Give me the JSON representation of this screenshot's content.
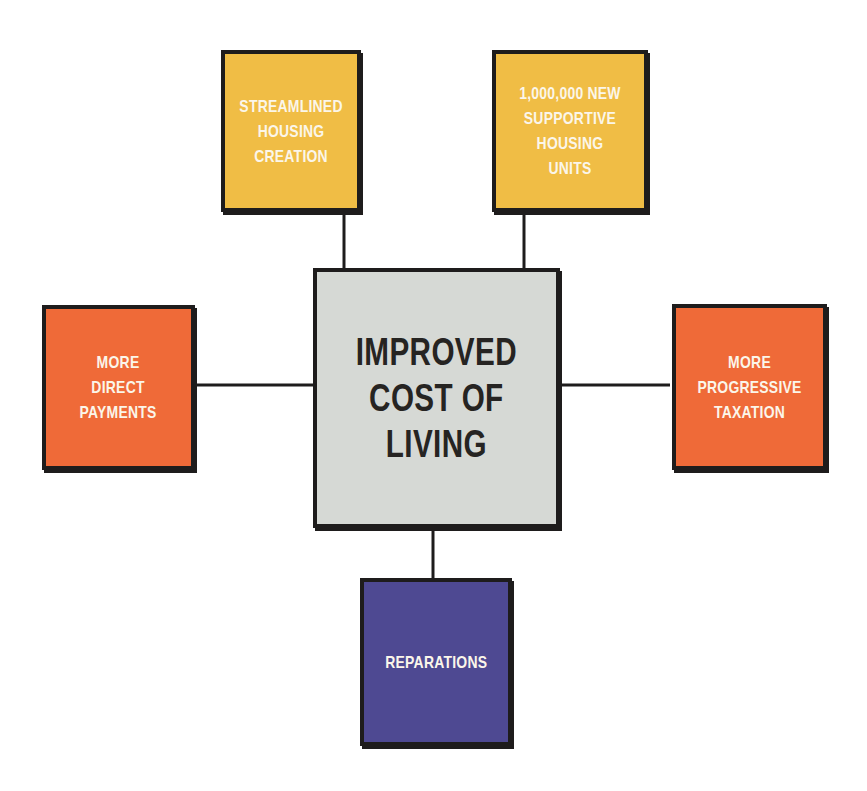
{
  "diagram": {
    "center": {
      "label": "IMPROVED\nCOST OF\nLIVING",
      "color": "#d6d9d5"
    },
    "inputs": [
      {
        "id": "streamlined-housing",
        "label": "STREAMLINED\nHOUSING\nCREATION",
        "color": "#f0bd45",
        "position": "top-left"
      },
      {
        "id": "supportive-housing",
        "label": "1,000,000 NEW\nSUPPORTIVE\nHOUSING\nUNITS",
        "color": "#f0bd45",
        "position": "top-right"
      },
      {
        "id": "direct-payments",
        "label": "MORE\nDIRECT\nPAYMENTS",
        "color": "#ef6a38",
        "position": "left"
      },
      {
        "id": "progressive-taxation",
        "label": "MORE\nPROGRESSIVE\nTAXATION",
        "color": "#ef6a38",
        "position": "right"
      },
      {
        "id": "reparations",
        "label": "REPARATIONS",
        "color": "#4e4992",
        "position": "bottom"
      }
    ],
    "edges": [
      {
        "from": "streamlined-housing",
        "to": "center"
      },
      {
        "from": "supportive-housing",
        "to": "center"
      },
      {
        "from": "direct-payments",
        "to": "center"
      },
      {
        "from": "progressive-taxation",
        "to": "center"
      },
      {
        "from": "reparations",
        "to": "center"
      }
    ]
  }
}
